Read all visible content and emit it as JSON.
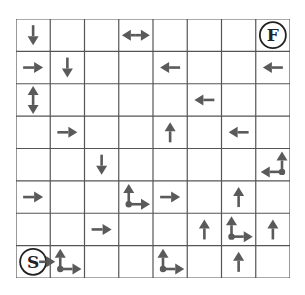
{
  "grid": {
    "rows": 8,
    "cols": 8,
    "line_color": "#555555",
    "arrow_color": "#5a5a5a",
    "start_label": "S",
    "finish_label": "F",
    "start": {
      "row": 7,
      "col": 0
    },
    "finish": {
      "row": 0,
      "col": 7
    },
    "cells": [
      {
        "row": 0,
        "col": 0,
        "arrows": [
          "down"
        ]
      },
      {
        "row": 0,
        "col": 3,
        "arrows": [
          "left-right"
        ]
      },
      {
        "row": 1,
        "col": 0,
        "arrows": [
          "right"
        ]
      },
      {
        "row": 1,
        "col": 1,
        "arrows": [
          "down"
        ]
      },
      {
        "row": 1,
        "col": 4,
        "arrows": [
          "left"
        ]
      },
      {
        "row": 1,
        "col": 7,
        "arrows": [
          "left"
        ]
      },
      {
        "row": 2,
        "col": 0,
        "arrows": [
          "up-down"
        ]
      },
      {
        "row": 2,
        "col": 5,
        "arrows": [
          "left"
        ]
      },
      {
        "row": 3,
        "col": 1,
        "arrows": [
          "right"
        ]
      },
      {
        "row": 3,
        "col": 4,
        "arrows": [
          "up"
        ]
      },
      {
        "row": 3,
        "col": 6,
        "arrows": [
          "left"
        ]
      },
      {
        "row": 4,
        "col": 2,
        "arrows": [
          "down"
        ]
      },
      {
        "row": 4,
        "col": 7,
        "arrows": [
          "corner-up-left"
        ]
      },
      {
        "row": 5,
        "col": 0,
        "arrows": [
          "right"
        ]
      },
      {
        "row": 5,
        "col": 3,
        "arrows": [
          "corner-up-right"
        ]
      },
      {
        "row": 5,
        "col": 4,
        "arrows": [
          "right"
        ]
      },
      {
        "row": 5,
        "col": 6,
        "arrows": [
          "up"
        ]
      },
      {
        "row": 6,
        "col": 2,
        "arrows": [
          "right"
        ]
      },
      {
        "row": 6,
        "col": 5,
        "arrows": [
          "up"
        ]
      },
      {
        "row": 6,
        "col": 6,
        "arrows": [
          "corner-up-right"
        ]
      },
      {
        "row": 6,
        "col": 7,
        "arrows": [
          "up"
        ]
      },
      {
        "row": 7,
        "col": 0,
        "arrows": [
          "start-right"
        ]
      },
      {
        "row": 7,
        "col": 1,
        "arrows": [
          "corner-up-right"
        ]
      },
      {
        "row": 7,
        "col": 4,
        "arrows": [
          "corner-up-right"
        ]
      },
      {
        "row": 7,
        "col": 6,
        "arrows": [
          "up"
        ]
      }
    ]
  }
}
